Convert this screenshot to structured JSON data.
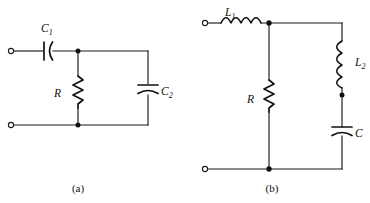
{
  "figure": {
    "kind": "circuit-diagram",
    "background_color": "#ffffff",
    "line_color": "#1a1a1a",
    "subfigures": [
      {
        "id": "a",
        "caption": "(a)",
        "caption_x": 78,
        "caption_y": 191,
        "topology": "high-pass series C1 into parallel R and C2",
        "components": [
          {
            "ref": "C1",
            "label_main": "C",
            "label_sub": "1",
            "type": "capacitor",
            "orientation": "horizontal",
            "style": "one-flat-one-curved-plate",
            "label_x": 47,
            "label_y": 32
          },
          {
            "ref": "R",
            "label_main": "R",
            "label_sub": "",
            "type": "resistor",
            "orientation": "vertical",
            "style": "zigzag",
            "label_x": 59,
            "label_y": 93
          },
          {
            "ref": "C2",
            "label_main": "C",
            "label_sub": "2",
            "type": "capacitor",
            "orientation": "vertical",
            "style": "one-flat-one-curved-plate",
            "label_x": 158,
            "label_y": 95
          }
        ],
        "terminals": [
          {
            "name": "input-top",
            "x": 10,
            "y": 51
          },
          {
            "name": "input-bottom",
            "x": 10,
            "y": 125
          }
        ],
        "junctions": [
          {
            "name": "top-node",
            "x": 78,
            "y": 51
          },
          {
            "name": "bottom-node",
            "x": 78,
            "y": 125
          }
        ]
      },
      {
        "id": "b",
        "caption": "(b)",
        "caption_x": 272,
        "caption_y": 191,
        "topology": "series L1 into parallel R and series L2-C branch",
        "components": [
          {
            "ref": "L1",
            "label_main": "L",
            "label_sub": "1",
            "type": "inductor",
            "orientation": "horizontal",
            "style": "four-loop-coil",
            "label_x": 230,
            "label_y": 16
          },
          {
            "ref": "R",
            "label_main": "R",
            "label_sub": "",
            "type": "resistor",
            "orientation": "vertical",
            "style": "zigzag",
            "label_x": 252,
            "label_y": 99
          },
          {
            "ref": "L2",
            "label_main": "L",
            "label_sub": "2",
            "type": "inductor",
            "orientation": "vertical",
            "style": "four-loop-coil",
            "label_x": 351,
            "label_y": 66
          },
          {
            "ref": "C",
            "label_main": "C",
            "label_sub": "",
            "type": "capacitor",
            "orientation": "vertical",
            "style": "one-flat-one-curved-plate",
            "label_x": 354,
            "label_y": 137
          }
        ],
        "terminals": [
          {
            "name": "input-top",
            "x": 204,
            "y": 23
          },
          {
            "name": "input-bottom",
            "x": 204,
            "y": 169
          }
        ],
        "junctions": [
          {
            "name": "top-node",
            "x": 269,
            "y": 23
          },
          {
            "name": "mid-right-node",
            "x": 342,
            "y": 95
          },
          {
            "name": "bottom-node",
            "x": 269,
            "y": 169
          }
        ]
      }
    ]
  }
}
